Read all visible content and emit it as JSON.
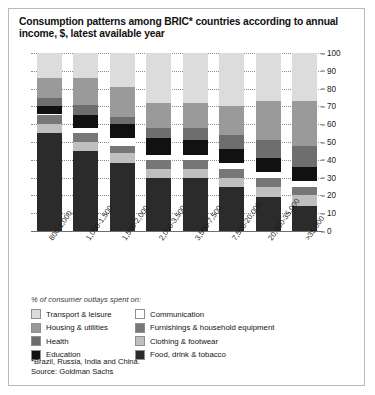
{
  "title": "Consumption patterns among BRIC* countries according to annual income, $, latest available year",
  "legend_title": "% of consumer outlays spent on:",
  "footnote_line1": "*Brazil, Russia, India and China.",
  "footnote_line2": "Source: Goldman Sachs",
  "colors": {
    "transport_leisure": "#dcdcdc",
    "housing_utilities": "#9a9a9a",
    "health": "#6e6e6e",
    "education": "#111111",
    "communication": "#ffffff",
    "furnishings": "#777777",
    "clothing_footwear": "#bfbfbf",
    "food_drink_tobacco": "#2b2b2b",
    "grid": "#8d8d8d",
    "axis": "#6e6e6e",
    "border": "#b9b9b9"
  },
  "legend": [
    {
      "label": "Transport & leisure",
      "swatch": "#dcdcdc"
    },
    {
      "label": "Communication",
      "swatch": "#ffffff"
    },
    {
      "label": "Housing & utilities",
      "swatch": "#9a9a9a"
    },
    {
      "label": "Furnishings & household equipment",
      "swatch": "#777777"
    },
    {
      "label": "Health",
      "swatch": "#6e6e6e"
    },
    {
      "label": "Clothing & footwear",
      "swatch": "#bfbfbf"
    },
    {
      "label": "Education",
      "swatch": "#111111"
    },
    {
      "label": "Food, drink & tobacco",
      "swatch": "#2b2b2b"
    }
  ],
  "chart_data": {
    "type": "bar",
    "stacked": true,
    "orientation": "vertical",
    "title": "Consumption patterns among BRIC* countries according to annual income, $, latest available year",
    "xlabel": "",
    "ylabel": "",
    "ylim": [
      0,
      100
    ],
    "yticks": [
      0,
      10,
      20,
      30,
      40,
      50,
      60,
      70,
      80,
      90,
      100
    ],
    "y_axis_position": "right",
    "grid": true,
    "grid_style": "dotted-horizontal",
    "legend_position": "below-plot",
    "categories": [
      "800-1,000",
      "1,000-1,500",
      "1,500-2,000",
      "2,000-3,500",
      "3,500-7,500",
      "7,500-20,000",
      "20,000-35,000",
      ">35,000"
    ],
    "stack_order_bottom_to_top": [
      "Food, drink & tobacco",
      "Clothing & footwear",
      "Furnishings & household equipment",
      "Communication",
      "Education",
      "Health",
      "Housing & utilities",
      "Transport & leisure"
    ],
    "series": [
      {
        "name": "Food, drink & tobacco",
        "color": "#2b2b2b",
        "values": [
          55,
          45,
          38,
          30,
          30,
          25,
          19,
          14
        ]
      },
      {
        "name": "Clothing & footwear",
        "color": "#bfbfbf",
        "values": [
          5,
          5,
          6,
          5,
          5,
          5,
          6,
          6
        ]
      },
      {
        "name": "Furnishings & household equipment",
        "color": "#777777",
        "values": [
          5,
          5,
          4,
          5,
          5,
          5,
          5,
          5
        ]
      },
      {
        "name": "Communication",
        "color": "#ffffff",
        "values": [
          1,
          3,
          4,
          3,
          3,
          3,
          3,
          3
        ]
      },
      {
        "name": "Education",
        "color": "#111111",
        "values": [
          4,
          7,
          8,
          9,
          8,
          8,
          8,
          8
        ]
      },
      {
        "name": "Health",
        "color": "#6e6e6e",
        "values": [
          5,
          6,
          4,
          6,
          7,
          8,
          10,
          12
        ]
      },
      {
        "name": "Housing & utilities",
        "color": "#9a9a9a",
        "values": [
          11,
          15,
          17,
          14,
          14,
          16,
          22,
          25
        ]
      },
      {
        "name": "Transport & leisure",
        "color": "#dcdcdc",
        "values": [
          14,
          14,
          19,
          28,
          28,
          30,
          27,
          27
        ]
      }
    ]
  }
}
